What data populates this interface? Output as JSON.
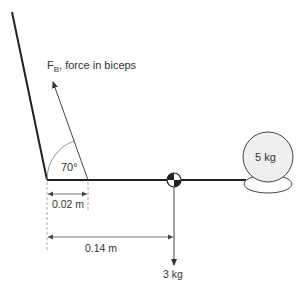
{
  "diagram": {
    "labels": {
      "force_main": "F",
      "force_sub": "B",
      "force_desc": ", force in biceps",
      "angle": "70°",
      "dist_short": "0.02 m",
      "dist_long": "0.14 m",
      "forearm_weight": "3 kg",
      "ball_weight": "5 kg"
    },
    "colors": {
      "line": "#222222",
      "thin": "#555555",
      "dashed": "#aaaaaa",
      "ball_fill": "#efefef"
    }
  }
}
